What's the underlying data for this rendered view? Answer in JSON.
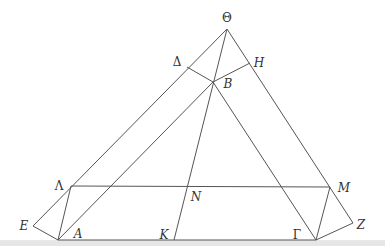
{
  "diagram": {
    "type": "geometry",
    "stroke_color": "#555555",
    "points": {
      "Theta": {
        "label": "Θ",
        "x": 227,
        "y": 29,
        "lx": 227,
        "ly": 22,
        "upright": true
      },
      "Delta": {
        "label": "Δ",
        "x": 187,
        "y": 67,
        "lx": 177,
        "ly": 66,
        "upright": true
      },
      "H": {
        "label": "H",
        "x": 250,
        "y": 63,
        "lx": 259,
        "ly": 67,
        "upright": false
      },
      "B": {
        "label": "B",
        "x": 213,
        "y": 82,
        "lx": 228,
        "ly": 88,
        "upright": false
      },
      "Lambda": {
        "label": "Λ",
        "x": 71,
        "y": 186,
        "lx": 59,
        "ly": 190,
        "upright": true
      },
      "N": {
        "label": "N",
        "x": 187,
        "y": 187,
        "lx": 196,
        "ly": 201,
        "upright": false
      },
      "M": {
        "label": "M",
        "x": 330,
        "y": 187,
        "lx": 344,
        "ly": 192,
        "upright": false
      },
      "E": {
        "label": "E",
        "x": 33,
        "y": 226,
        "lx": 24,
        "ly": 230,
        "upright": false
      },
      "A": {
        "label": "A",
        "x": 58,
        "y": 240,
        "lx": 78,
        "ly": 238,
        "upright": false
      },
      "K": {
        "label": "K",
        "x": 174,
        "y": 240,
        "lx": 164,
        "ly": 239,
        "upright": false
      },
      "Gamma": {
        "label": "Γ",
        "x": 316,
        "y": 240,
        "lx": 297,
        "ly": 239,
        "upright": true
      },
      "Z": {
        "label": "Z",
        "x": 353,
        "y": 223,
        "lx": 361,
        "ly": 229,
        "upright": false
      }
    },
    "segments": [
      [
        "Theta",
        "E"
      ],
      [
        "Theta",
        "Z"
      ],
      [
        "Theta",
        "K"
      ],
      [
        "Delta",
        "B"
      ],
      [
        "B",
        "H"
      ],
      [
        "B",
        "A"
      ],
      [
        "B",
        "Gamma"
      ],
      [
        "Lambda",
        "M"
      ],
      [
        "Lambda",
        "A"
      ],
      [
        "M",
        "Gamma"
      ],
      [
        "E",
        "A"
      ],
      [
        "Z",
        "Gamma"
      ],
      [
        "A",
        "Gamma"
      ]
    ]
  }
}
